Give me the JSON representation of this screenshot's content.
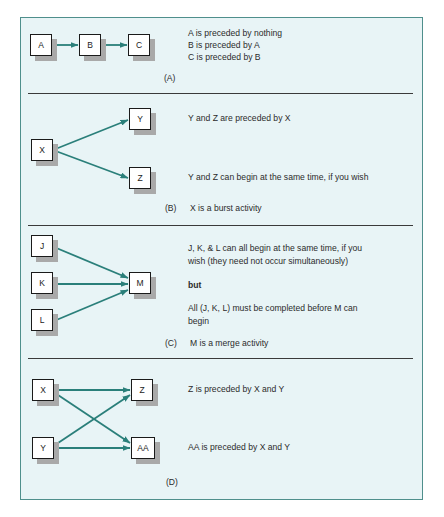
{
  "figure": {
    "accent_color": "#2a7f7a",
    "panel_fill": "#e8f4f6",
    "panel_border": "#4f8f8c"
  },
  "sections": {
    "a": {
      "label": "(A)",
      "nodes": [
        "A",
        "B",
        "C"
      ],
      "lines": [
        "A is preceded by nothing",
        "B is preceded by A",
        "C is preceded by B"
      ]
    },
    "b": {
      "label": "(B)",
      "nodes": [
        "X",
        "Y",
        "Z"
      ],
      "line1": "Y and Z are preceded by X",
      "line2": "Y and Z can begin at the same time, if you wish",
      "caption": "X is a burst activity"
    },
    "c": {
      "label": "(C)",
      "nodes": [
        "J",
        "K",
        "L",
        "M"
      ],
      "line1a": "J, K, & L can all begin at the same time, if you",
      "line1b": "wish (they need not occur simultaneously)",
      "but": "but",
      "line2a": "All (J, K, L) must be completed before M can",
      "line2b": "begin",
      "caption": "M is a merge activity"
    },
    "d": {
      "label": "(D)",
      "nodes": [
        "X",
        "Y",
        "Z",
        "AA"
      ],
      "line1": "Z is preceded by X and Y",
      "line2": "AA is preceded by X and Y"
    }
  }
}
